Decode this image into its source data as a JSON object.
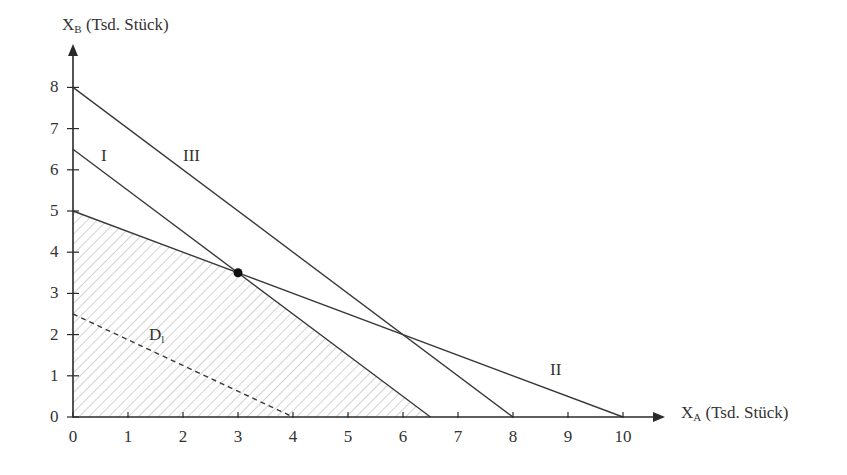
{
  "chart_data": {
    "type": "line",
    "title": "",
    "xlabel": "X_A (Tsd. Stück)",
    "ylabel": "X_B (Tsd. Stück)",
    "xlabel_main": "X",
    "xlabel_sub": "A",
    "xlabel_rest": " (Tsd. Stück)",
    "ylabel_main": "X",
    "ylabel_sub": "B",
    "ylabel_rest": " (Tsd. Stück)",
    "xlim": [
      0,
      10.8
    ],
    "ylim": [
      0,
      8.8
    ],
    "x_ticks": [
      0,
      1,
      2,
      3,
      4,
      5,
      6,
      7,
      8,
      9,
      10
    ],
    "y_ticks": [
      0,
      1,
      2,
      3,
      4,
      5,
      6,
      7,
      8
    ],
    "grid": false,
    "legend": null,
    "series": [
      {
        "name": "I",
        "style": "solid",
        "points": [
          [
            0,
            6.5
          ],
          [
            6.5,
            0
          ]
        ],
        "label_pos": [
          0.6,
          6.2
        ]
      },
      {
        "name": "II",
        "style": "solid",
        "points": [
          [
            0,
            5
          ],
          [
            10,
            0
          ]
        ],
        "label_pos": [
          8.9,
          1.0
        ]
      },
      {
        "name": "III",
        "style": "solid",
        "points": [
          [
            0,
            8
          ],
          [
            8,
            0
          ]
        ],
        "label_pos": [
          2.2,
          6.2
        ]
      },
      {
        "name": "D_l",
        "style": "dashed",
        "points": [
          [
            0,
            2.5
          ],
          [
            4,
            0
          ]
        ],
        "label_pos": [
          1.45,
          1.85
        ]
      }
    ],
    "feasible_region": {
      "fill": "hatched",
      "vertices": [
        [
          0,
          0
        ],
        [
          0,
          5
        ],
        [
          3,
          3.5
        ],
        [
          6.5,
          0
        ]
      ]
    },
    "optimum_point": {
      "x": 3,
      "y": 3.5
    },
    "annotations": [
      {
        "text": "I",
        "x": 0.6,
        "y": 6.2
      },
      {
        "text": "II",
        "x": 8.9,
        "y": 1.0
      },
      {
        "text": "III",
        "x": 2.2,
        "y": 6.2
      },
      {
        "text": "D_l",
        "x": 1.45,
        "y": 1.85
      }
    ]
  },
  "labels": {
    "line_I": "I",
    "line_II": "II",
    "line_III": "III",
    "iso_main": "D",
    "iso_sub": "l"
  },
  "colors": {
    "axis": "#2a2a2a",
    "line": "#3a3a3a",
    "hatch": "#c8c8c8",
    "point": "#111111"
  }
}
